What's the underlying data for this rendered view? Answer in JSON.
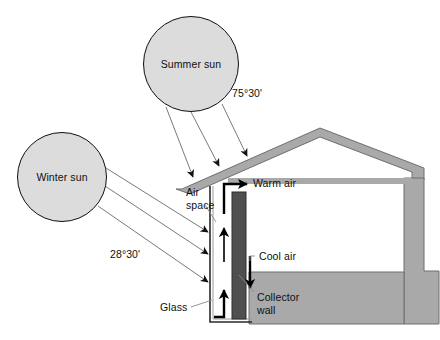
{
  "diagram": {
    "suns": [
      {
        "id": "summer",
        "label": "Summer sun",
        "cx": 191,
        "cy": 64,
        "r": 48
      },
      {
        "id": "winter",
        "label": "Winter sun",
        "cx": 62,
        "cy": 177,
        "r": 45
      }
    ],
    "angles": [
      {
        "id": "summer-angle",
        "value": "75°30'",
        "x": 232,
        "y": 93
      },
      {
        "id": "winter-angle",
        "value": "28°30'",
        "x": 110,
        "y": 254
      }
    ],
    "callouts": [
      {
        "id": "air-space",
        "line1": "Air",
        "line2": "space",
        "x": 186,
        "y": 188
      },
      {
        "id": "warm-air",
        "line1": "Warm air",
        "line2": "",
        "x": 253,
        "y": 181
      },
      {
        "id": "cool-air",
        "line1": "Cool air",
        "line2": "",
        "x": 257,
        "y": 259
      },
      {
        "id": "collector-wall",
        "line1": "Collector",
        "line2": "wall",
        "x": 257,
        "y": 297
      },
      {
        "id": "glass",
        "line1": "Glass",
        "line2": "",
        "x": 163,
        "y": 310
      }
    ],
    "colors": {
      "sun_fill": "#dcdcdc",
      "sun_stroke": "#101010",
      "house_fill": "#a9a9a9",
      "house_stroke": "#6e6e6e",
      "collector_fill": "#4f4f4f",
      "ray_stroke": "#7a7a7a",
      "arrow_black": "#000000",
      "leader_stroke": "#8a8a8a",
      "glass_stroke": "#2a2a2a",
      "background": "#ffffff"
    },
    "elements": {
      "roof": "gabled-roof-with-extended-left-eave",
      "collector_wall": "vertical-dark-masonry-strip",
      "glass": "glazing-outline-left-of-collector",
      "air_flow": [
        "warm-air-up-and-right",
        "cool-air-down-right",
        "return-air-up-left"
      ]
    },
    "summer_ray_count": 3,
    "winter_ray_count": 3
  }
}
